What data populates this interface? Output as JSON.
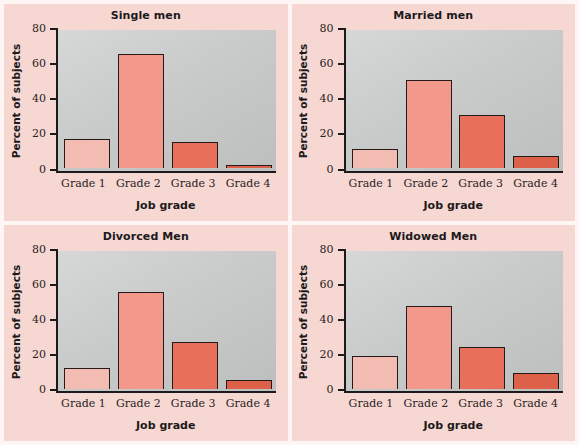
{
  "figure": {
    "background_color": "#fdf6f4",
    "panel_background_color": "#f6d7d2",
    "plot_background": "#cdcfcf",
    "axis_color": "#1d1a1b"
  },
  "chart_data": {
    "type": "bar",
    "title": "",
    "xlabel": "Job grade",
    "ylabel": "Percent of subjects",
    "categories": [
      "Grade 1",
      "Grade 2",
      "Grade 3",
      "Grade 4"
    ],
    "ylim": [
      0,
      80
    ],
    "yticks": [
      0,
      20,
      40,
      60,
      80
    ],
    "ytick_labels": [
      "0",
      "20",
      "40",
      "60",
      "80"
    ],
    "grid": false,
    "legend": "none",
    "bar_colors": [
      "#f3bcb3",
      "#f2998b",
      "#e8705a",
      "#dd6148"
    ],
    "panels": [
      {
        "title": "Single men",
        "categories": [
          "Grade 1",
          "Grade 2",
          "Grade 3",
          "Grade 4"
        ],
        "values": [
          17,
          66,
          15,
          2
        ],
        "xlabel": "Job grade",
        "ylabel": "Percent of subjects"
      },
      {
        "title": "Married men",
        "categories": [
          "Grade 1",
          "Grade 2",
          "Grade 3",
          "Grade 4"
        ],
        "values": [
          11,
          51,
          31,
          7
        ],
        "xlabel": "Job grade",
        "ylabel": "Percent of subjects"
      },
      {
        "title": "Divorced Men",
        "categories": [
          "Grade 1",
          "Grade 2",
          "Grade 3",
          "Grade 4"
        ],
        "values": [
          12,
          56,
          27,
          5
        ],
        "xlabel": "Job grade",
        "ylabel": "Percent of subjects"
      },
      {
        "title": "Widowed Men",
        "categories": [
          "Grade 1",
          "Grade 2",
          "Grade 3",
          "Grade 4"
        ],
        "values": [
          19,
          48,
          24,
          9
        ],
        "xlabel": "Job grade",
        "ylabel": "Percent of subjects"
      }
    ]
  }
}
